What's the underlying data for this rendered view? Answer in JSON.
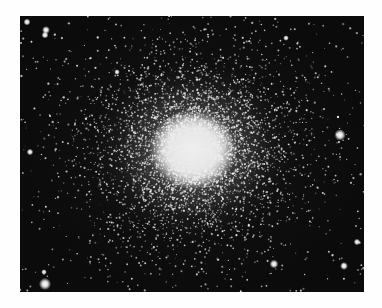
{
  "image": {
    "subject": "globular star cluster",
    "description": "Black-and-white photograph of a dense globular star cluster with a bright white core and thousands of stars thinning toward the edges",
    "colors": {
      "background_border": "#fefefe",
      "sky": "#0b0b0b",
      "core": "#eeeeee",
      "stars": "#ffffff"
    },
    "photo_bounds": {
      "x": 20,
      "y": 16,
      "width": 344,
      "height": 276
    },
    "core_center": {
      "x": 193,
      "y": 150
    },
    "bright_stars": [
      {
        "x": 340,
        "y": 135,
        "r": 2.6
      },
      {
        "x": 45,
        "y": 284,
        "r": 2.8
      },
      {
        "x": 274,
        "y": 264,
        "r": 2.0
      },
      {
        "x": 344,
        "y": 266,
        "r": 1.8
      },
      {
        "x": 357,
        "y": 242,
        "r": 1.5
      },
      {
        "x": 27,
        "y": 22,
        "r": 1.6
      },
      {
        "x": 46,
        "y": 30,
        "r": 1.8
      },
      {
        "x": 45,
        "y": 35,
        "r": 1.6
      },
      {
        "x": 30,
        "y": 152,
        "r": 1.5
      },
      {
        "x": 117,
        "y": 72,
        "r": 1.3
      },
      {
        "x": 286,
        "y": 38,
        "r": 1.3
      },
      {
        "x": 44,
        "y": 272,
        "r": 1.3
      }
    ],
    "field": {
      "seed": 1337,
      "cluster_stars": 5200,
      "background_stars": 420
    }
  }
}
